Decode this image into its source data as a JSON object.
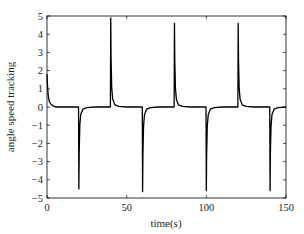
{
  "chart_data": {
    "type": "line",
    "title": "",
    "xlabel": "time(s)",
    "ylabel": "angle speed tracking",
    "xlim": [
      0,
      150
    ],
    "ylim": [
      -5,
      5
    ],
    "xticks": [
      0,
      50,
      100,
      150
    ],
    "yticks": [
      5,
      4,
      3,
      2,
      1,
      0,
      -1,
      -2,
      -3,
      -4,
      -5
    ],
    "grid": false,
    "legend": null,
    "series": [
      {
        "name": "angle speed tracking",
        "color": "#000000",
        "x": [
          0,
          0.3,
          0.8,
          1.5,
          2.5,
          4,
          6,
          10,
          19.8,
          20,
          20.2,
          20.6,
          21.2,
          22.5,
          25,
          30,
          39.8,
          40,
          40.2,
          40.6,
          41.2,
          42.5,
          45,
          50,
          59.8,
          60,
          60.2,
          60.6,
          61.2,
          62.5,
          65,
          70,
          79.8,
          80,
          80.2,
          80.6,
          81.2,
          82.5,
          85,
          90,
          99.8,
          100,
          100.2,
          100.6,
          101.2,
          102.5,
          105,
          110,
          119.8,
          120,
          120.2,
          120.6,
          121.2,
          122.5,
          125,
          130,
          139.8,
          140,
          140.2,
          140.6,
          141.2,
          142.5,
          145,
          150
        ],
        "y": [
          1.8,
          1.2,
          0.6,
          0.3,
          0.15,
          0.05,
          0.0,
          0.0,
          0.0,
          -4.5,
          -2.5,
          -1.0,
          -0.4,
          -0.12,
          -0.03,
          0.0,
          0.0,
          4.9,
          2.7,
          1.1,
          0.45,
          0.13,
          0.03,
          0.0,
          0.0,
          -4.65,
          -2.6,
          -1.05,
          -0.42,
          -0.12,
          -0.03,
          0.0,
          0.0,
          4.6,
          2.55,
          1.05,
          0.42,
          0.12,
          0.03,
          0.0,
          0.0,
          -4.6,
          -2.55,
          -1.05,
          -0.42,
          -0.12,
          -0.03,
          0.0,
          0.0,
          4.6,
          2.55,
          1.05,
          0.42,
          0.12,
          0.03,
          0.0,
          0.0,
          -4.6,
          -2.55,
          -1.05,
          -0.42,
          -0.12,
          -0.03,
          0.0
        ]
      }
    ],
    "annotations": []
  },
  "labels": {
    "xlabel": "time(s)",
    "ylabel": "angle speed tracking",
    "xtick_labels": [
      "0",
      "50",
      "100",
      "150"
    ],
    "ytick_labels": [
      "5",
      "4",
      "3",
      "2",
      "1",
      "0",
      "−1",
      "−2",
      "−3",
      "−4",
      "−5"
    ]
  }
}
